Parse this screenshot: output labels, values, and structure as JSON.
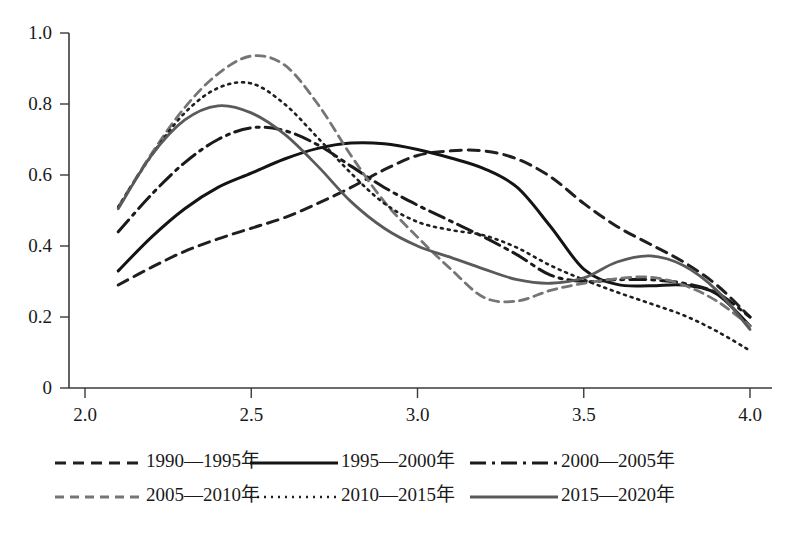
{
  "chart_data": {
    "type": "line",
    "title": "",
    "subtitle": "",
    "xlabel": "",
    "ylabel": "",
    "xlim": [
      2.0,
      4.0
    ],
    "ylim": [
      0,
      1.0
    ],
    "xticks": [
      "2.0",
      "2.5",
      "3.0",
      "3.5",
      "4.0"
    ],
    "xtick_values": [
      2.0,
      2.5,
      3.0,
      3.5,
      4.0
    ],
    "yticks": [
      "0",
      "0.2",
      "0.4",
      "0.6",
      "0.8",
      "1.0"
    ],
    "ytick_values": [
      0,
      0.2,
      0.4,
      0.6,
      0.8,
      1.0
    ],
    "grid": false,
    "legend_position": "bottom",
    "x": [
      2.1,
      2.2,
      2.3,
      2.4,
      2.5,
      2.6,
      2.7,
      2.8,
      2.9,
      3.0,
      3.1,
      3.2,
      3.3,
      3.4,
      3.5,
      3.6,
      3.7,
      3.8,
      3.9,
      4.0
    ],
    "series": [
      {
        "name": "1990—1995年",
        "style": "dashed",
        "color": "#1f1f1f",
        "width": 3.0,
        "dasharray": "11,7",
        "values": [
          0.29,
          0.34,
          0.385,
          0.42,
          0.45,
          0.48,
          0.52,
          0.565,
          0.615,
          0.655,
          0.668,
          0.668,
          0.645,
          0.595,
          0.52,
          0.455,
          0.405,
          0.355,
          0.29,
          0.2
        ]
      },
      {
        "name": "1995—2000年",
        "style": "solid",
        "color": "#141414",
        "width": 3.0,
        "dasharray": "",
        "values": [
          0.33,
          0.425,
          0.505,
          0.565,
          0.605,
          0.645,
          0.675,
          0.69,
          0.688,
          0.672,
          0.648,
          0.618,
          0.565,
          0.455,
          0.335,
          0.292,
          0.288,
          0.29,
          0.265,
          0.175
        ]
      },
      {
        "name": "2000—2005年",
        "style": "dashdot",
        "color": "#1a1a1a",
        "width": 3.0,
        "dasharray": "16,6,3,6",
        "values": [
          0.44,
          0.545,
          0.635,
          0.7,
          0.733,
          0.725,
          0.685,
          0.625,
          0.565,
          0.515,
          0.47,
          0.425,
          0.375,
          0.318,
          0.3,
          0.305,
          0.305,
          0.295,
          0.268,
          0.2
        ]
      },
      {
        "name": "2005—2010年",
        "style": "dashed-gray",
        "color": "#757575",
        "width": 2.8,
        "dasharray": "9,6",
        "values": [
          0.51,
          0.66,
          0.79,
          0.885,
          0.935,
          0.91,
          0.8,
          0.655,
          0.525,
          0.425,
          0.335,
          0.255,
          0.245,
          0.275,
          0.295,
          0.308,
          0.312,
          0.29,
          0.245,
          0.175
        ]
      },
      {
        "name": "2010—2015年",
        "style": "dotted",
        "color": "#1f1f1f",
        "width": 2.6,
        "dasharray": "2,5",
        "values": [
          0.51,
          0.655,
          0.775,
          0.845,
          0.858,
          0.8,
          0.705,
          0.605,
          0.52,
          0.468,
          0.445,
          0.43,
          0.395,
          0.345,
          0.305,
          0.27,
          0.238,
          0.205,
          0.16,
          0.105
        ]
      },
      {
        "name": "2015—2020年",
        "style": "solid-gray",
        "color": "#5a5a5a",
        "width": 2.8,
        "dasharray": "",
        "values": [
          0.505,
          0.655,
          0.755,
          0.795,
          0.775,
          0.715,
          0.625,
          0.525,
          0.45,
          0.4,
          0.368,
          0.335,
          0.305,
          0.295,
          0.31,
          0.355,
          0.372,
          0.345,
          0.275,
          0.165
        ]
      }
    ]
  },
  "legend": {
    "rows": [
      [
        {
          "label": "1990—1995年",
          "series_index": 0
        },
        {
          "label": "1995—2000年",
          "series_index": 1
        },
        {
          "label": "2000—2005年",
          "series_index": 2
        }
      ],
      [
        {
          "label": "2005—2010年",
          "series_index": 3
        },
        {
          "label": "2010—2015年",
          "series_index": 4
        },
        {
          "label": "2015—2020年",
          "series_index": 5
        }
      ]
    ]
  }
}
